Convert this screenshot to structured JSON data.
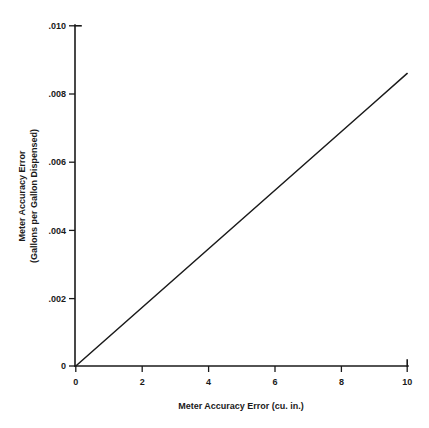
{
  "chart_data": {
    "type": "line",
    "title": "",
    "subtitle": "",
    "xlabel": "Meter Accuracy Error (cu. in.)",
    "ylabel": "Meter Accuracy Error",
    "ylabel_line2": "(Gallons per Gallon Dispensed)",
    "xlim": [
      0,
      10
    ],
    "ylim": [
      0,
      0.01
    ],
    "grid": false,
    "legend": null,
    "x_ticks": [
      0,
      2,
      4,
      6,
      8,
      10
    ],
    "x_tick_labels": [
      "0",
      "2",
      "4",
      "6",
      "8",
      "10"
    ],
    "y_ticks": [
      0,
      0.002,
      0.004,
      0.006,
      0.008,
      0.01
    ],
    "y_tick_labels": [
      "0",
      ".002",
      ".004",
      ".006",
      ".008",
      ".010"
    ],
    "series": [
      {
        "name": "Meter accuracy error conversion",
        "x": [
          0,
          1,
          2,
          3,
          4,
          5,
          6,
          7,
          8,
          9,
          10
        ],
        "values": [
          0,
          0.00086,
          0.00172,
          0.00258,
          0.00344,
          0.0043,
          0.00516,
          0.00602,
          0.00688,
          0.00774,
          0.0086
        ],
        "color": "#1a1a1a"
      }
    ],
    "annotations": []
  },
  "axis_colors": {
    "line": "#1a1a1a",
    "text": "#1a1a1a",
    "background": "#ffffff"
  }
}
